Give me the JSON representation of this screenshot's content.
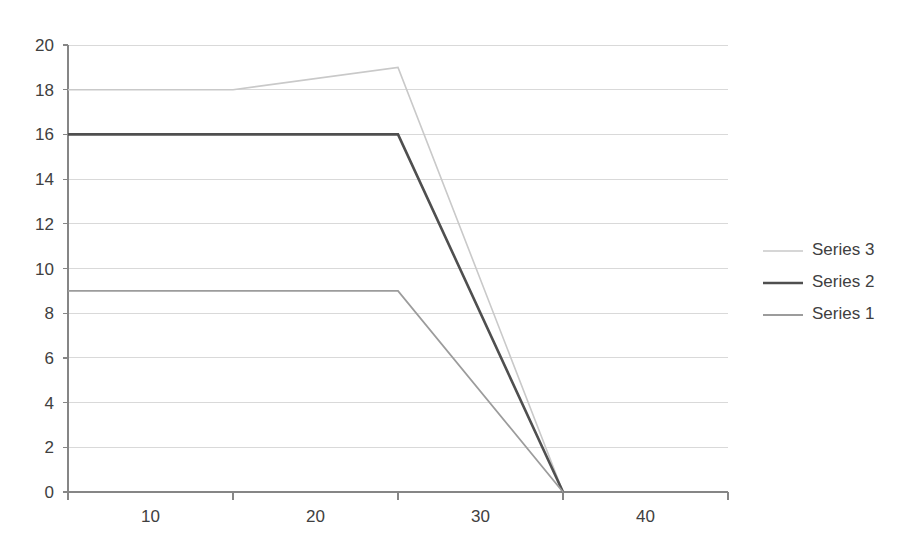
{
  "chart_data": {
    "type": "line",
    "title": "",
    "subtitle": "",
    "xlabel": "",
    "ylabel": "",
    "categories": [
      "10",
      "20",
      "30",
      "40"
    ],
    "x": [
      10,
      20,
      30,
      40
    ],
    "xlim": [
      10,
      40
    ],
    "ylim": [
      0,
      20
    ],
    "y_ticks": [
      0,
      2,
      4,
      6,
      8,
      10,
      12,
      14,
      16,
      18,
      20
    ],
    "y_tick_labels": [
      "0",
      "2",
      "4",
      "6",
      "8",
      "10",
      "12",
      "14",
      "16",
      "18",
      "20"
    ],
    "x_ticks": [
      10,
      20,
      30,
      40
    ],
    "x_tick_labels": [
      "10",
      "20",
      "30",
      "40"
    ],
    "grid": "horizontal",
    "grid_color": "#d9d9d9",
    "axis_color": "#868686",
    "legend_position": "right",
    "background": "#ffffff",
    "series": [
      {
        "name": "Series 3",
        "values": [
          18,
          18,
          19,
          0
        ],
        "color": "#c9c9c9",
        "width": 1.6
      },
      {
        "name": "Series 2",
        "values": [
          16,
          16,
          16,
          0
        ],
        "color": "#4f4f4f",
        "width": 2.6
      },
      {
        "name": "Series 1",
        "values": [
          9,
          9,
          9,
          0
        ],
        "color": "#9c9c9c",
        "width": 1.8
      }
    ],
    "legend_order": [
      "Series 3",
      "Series 2",
      "Series 1"
    ]
  },
  "legend": {
    "entries": [
      {
        "label": "Series 3"
      },
      {
        "label": "Series 2"
      },
      {
        "label": "Series 1"
      }
    ]
  },
  "axes": {
    "y_labels": [
      "20",
      "18",
      "16",
      "14",
      "12",
      "10",
      "8",
      "6",
      "4",
      "2",
      "0"
    ],
    "x_labels": [
      "10",
      "20",
      "30",
      "40"
    ]
  }
}
